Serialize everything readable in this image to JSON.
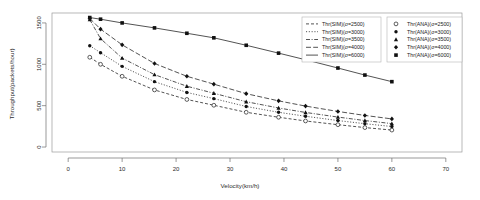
{
  "chart_data": {
    "type": "line",
    "title": "",
    "xlabel": "Velocity(km/h)",
    "ylabel": "Throughput(packets/hour)",
    "xlim": [
      -3,
      73
    ],
    "ylim": [
      -60,
      1620
    ],
    "xticks": [
      0,
      10,
      20,
      30,
      40,
      50,
      60,
      70
    ],
    "yticks": [
      0,
      500,
      1000,
      1500
    ],
    "grid": false,
    "legend_position": "top-right",
    "x": [
      4,
      6,
      10,
      16,
      22,
      27,
      33,
      39,
      44,
      50,
      55,
      60
    ],
    "series": [
      {
        "name": "sigma=2500",
        "legend_sim": "Thr(SIM)(σ=2500)",
        "legend_ana": "Thr(ANA)(σ=2500)",
        "marker": "open-circle",
        "linestyle": "dashed",
        "values": [
          1085,
          1000,
          855,
          690,
          575,
          505,
          420,
          360,
          315,
          270,
          235,
          205
        ]
      },
      {
        "name": "sigma=3000",
        "legend_sim": "Thr(SIM)(σ=3000)",
        "legend_ana": "Thr(ANA)(σ=3000)",
        "marker": "filled-circle",
        "linestyle": "dotted",
        "values": [
          1225,
          1140,
          975,
          790,
          660,
          585,
          490,
          420,
          372,
          320,
          282,
          248
        ]
      },
      {
        "name": "sigma=3500",
        "legend_sim": "Thr(SIM)(σ=3500)",
        "legend_ana": "Thr(ANA)(σ=3500)",
        "marker": "filled-triangle",
        "linestyle": "dashdot",
        "values": [
          1540,
          1310,
          1075,
          875,
          735,
          650,
          548,
          472,
          418,
          362,
          320,
          283
        ]
      },
      {
        "name": "sigma=4000",
        "legend_sim": "Thr(SIM)(σ=4000)",
        "legend_ana": "Thr(ANA)(σ=4000)",
        "marker": "filled-diamond",
        "linestyle": "longdash",
        "values": [
          1555,
          1425,
          1235,
          1010,
          855,
          760,
          645,
          558,
          495,
          430,
          382,
          340
        ]
      },
      {
        "name": "sigma=6000",
        "legend_sim": "Thr(SIM)(σ=6000)",
        "legend_ana": "Thr(ANA)(σ=6000)",
        "marker": "filled-square",
        "linestyle": "solid",
        "values": [
          1565,
          1545,
          1500,
          1440,
          1375,
          1320,
          1230,
          1135,
          1055,
          955,
          870,
          790
        ]
      }
    ]
  },
  "legend_sim": {
    "items": [
      "Thr(SIM)(σ=2500)",
      "Thr(SIM)(σ=3000)",
      "Thr(SIM)(σ=3500)",
      "Thr(SIM)(σ=4000)",
      "Thr(SIM)(σ=6000)"
    ]
  },
  "legend_ana": {
    "items": [
      "Thr(ANA)(σ=2500)",
      "Thr(ANA)(σ=3000)",
      "Thr(ANA)(σ=3500)",
      "Thr(ANA)(σ=4000)",
      "Thr(ANA)(σ=6000)"
    ]
  },
  "colors": {
    "line": "#1a1a1a",
    "axis": "#6e6e6e",
    "box": "#9a9a9a",
    "text": "#2b2b2b",
    "background": "#ffffff"
  }
}
